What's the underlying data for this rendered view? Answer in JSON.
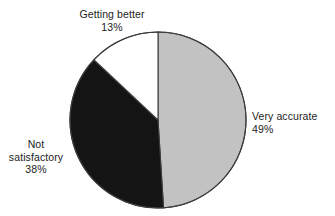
{
  "chart_data": {
    "type": "pie",
    "title": "",
    "subtitle": "",
    "xlabel": "",
    "ylabel": "",
    "legend_position": "none",
    "grid": false,
    "categories": [
      "Very accurate",
      "Not satisfactory",
      "Getting better"
    ],
    "values": [
      49,
      38,
      13
    ],
    "value_suffix": "%",
    "slices": [
      {
        "label": "Very accurate",
        "value": 49,
        "value_text": "49%",
        "color": "#c2c2c2",
        "start_angle_deg": 0,
        "end_angle_deg": 176.4,
        "label_position": "right"
      },
      {
        "label": "Not satisfactory",
        "value": 38,
        "value_text": "38%",
        "color": "#141414",
        "start_angle_deg": 176.4,
        "end_angle_deg": 313.2,
        "label_position": "left"
      },
      {
        "label": "Getting better",
        "value": 13,
        "value_text": "13%",
        "color": "#ffffff",
        "start_angle_deg": 313.2,
        "end_angle_deg": 360,
        "label_position": "top"
      }
    ],
    "outline_color": "#3c3c3c",
    "background_color": "#ffffff"
  },
  "labels": {
    "getting_better": {
      "name": "Getting better",
      "percent": "13%"
    },
    "very_accurate": {
      "name": "Very accurate",
      "percent": "49%"
    },
    "not_satisfactory": {
      "name_line1": "Not",
      "name_line2": "satisfactory",
      "percent": "38%"
    }
  }
}
